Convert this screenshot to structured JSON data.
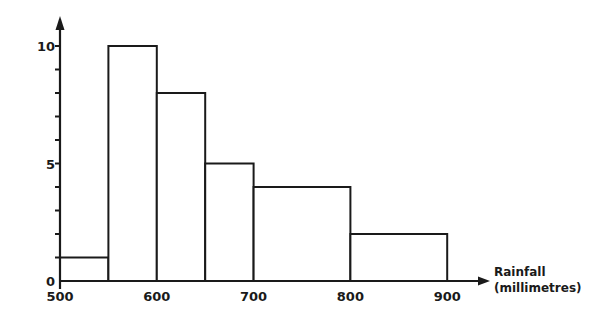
{
  "chart_data": {
    "type": "histogram",
    "title": "",
    "xlabel": "Rainfall (millimetres)",
    "xlabel_lines": [
      "Rainfall",
      "(millimetres)"
    ],
    "ylabel": "",
    "xlim": [
      500,
      900
    ],
    "ylim": [
      0,
      10
    ],
    "x_ticks": [
      500,
      600,
      700,
      800,
      900
    ],
    "x_tick_labels": [
      "500",
      "600",
      "700",
      "800",
      "900"
    ],
    "y_ticks": [
      0,
      1,
      2,
      3,
      4,
      5,
      6,
      7,
      8,
      9,
      10
    ],
    "y_tick_labels": {
      "0": "0",
      "5": "5",
      "10": "10"
    },
    "grid": false,
    "legend": null,
    "bins": [
      {
        "from": 500,
        "to": 550,
        "height": 1
      },
      {
        "from": 550,
        "to": 600,
        "height": 10
      },
      {
        "from": 600,
        "to": 650,
        "height": 8
      },
      {
        "from": 650,
        "to": 700,
        "height": 5
      },
      {
        "from": 700,
        "to": 800,
        "height": 4
      },
      {
        "from": 800,
        "to": 900,
        "height": 2
      }
    ],
    "colors": {
      "line": "#1a1a1a",
      "fill": "#ffffff",
      "background": "#ffffff"
    }
  }
}
